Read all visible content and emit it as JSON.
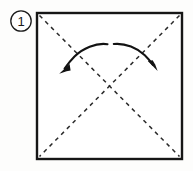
{
  "diagram": {
    "type": "origami-fold-instruction",
    "step_number": "1",
    "step_badge_shape": "circle",
    "title": "",
    "caption": "",
    "background_color": "#fdfdfc",
    "ink_color": "#1a1a1a",
    "paper": {
      "shape": "square",
      "label": "paper-square",
      "left": 37,
      "top": 13,
      "right": 182,
      "bottom": 159,
      "border_color": "#161616",
      "border_width": 2.4,
      "fill_color": "#ffffff"
    },
    "creases": [
      {
        "name": "diagonal-crease-tl-br",
        "style": "dashed",
        "from": [
          39,
          15
        ],
        "to": [
          180,
          157
        ],
        "dash_pattern": "4 4",
        "color": "#2a2a2a"
      },
      {
        "name": "diagonal-crease-tr-bl",
        "style": "dashed",
        "from": [
          180,
          15
        ],
        "to": [
          39,
          157
        ],
        "dash_pattern": "4 4",
        "color": "#2a2a2a"
      }
    ],
    "crease_intersection": [
      110,
      86
    ],
    "arrows": [
      {
        "name": "fold-arrow-left",
        "direction": "down-left",
        "tail": [
          107,
          44
        ],
        "head": [
          62,
          71
        ],
        "color": "#121212"
      },
      {
        "name": "fold-arrow-right",
        "direction": "down-right",
        "tail": [
          114,
          44
        ],
        "head": [
          153,
          69
        ],
        "color": "#121212"
      }
    ]
  }
}
